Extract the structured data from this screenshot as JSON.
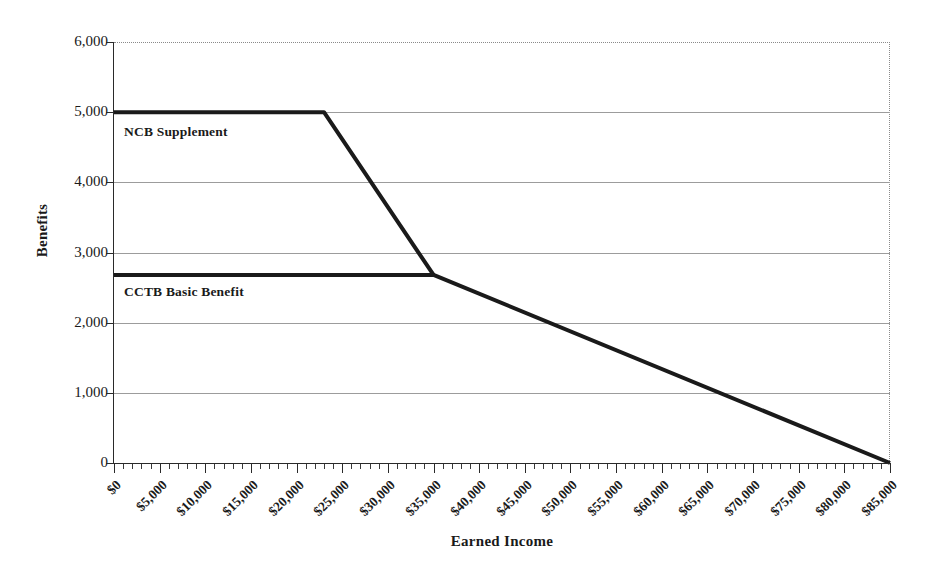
{
  "chart_data": {
    "type": "line",
    "title": "",
    "xlabel": "Earned Income",
    "ylabel": "Benefits",
    "xlim": [
      0,
      85000
    ],
    "ylim": [
      0,
      6000
    ],
    "grid": true,
    "legend_position": "inline-annotations",
    "x_tick_values": [
      0,
      5000,
      10000,
      15000,
      20000,
      25000,
      30000,
      35000,
      40000,
      45000,
      50000,
      55000,
      60000,
      65000,
      70000,
      75000,
      80000,
      85000
    ],
    "x_tick_labels": [
      "$0",
      "$5,000",
      "$10,000",
      "$15,000",
      "$20,000",
      "$25,000",
      "$30,000",
      "$35,000",
      "$40,000",
      "$45,000",
      "$50,000",
      "$55,000",
      "$60,000",
      "$65,000",
      "$70,000",
      "$75,000",
      "$80,000",
      "$85,000"
    ],
    "x_minor_tick_interval": 1000,
    "y_tick_values": [
      0,
      1000,
      2000,
      3000,
      4000,
      5000,
      6000
    ],
    "y_tick_labels": [
      "0",
      "1,000",
      "2,000",
      "3,000",
      "4,000",
      "5,000",
      "6,000"
    ],
    "series": [
      {
        "name": "NCB Supplement",
        "color": "#1a1a1a",
        "line_width": 4,
        "x": [
          0,
          23000,
          35000
        ],
        "values": [
          5000,
          5000,
          2680
        ]
      },
      {
        "name": "CCTB Basic Benefit",
        "color": "#1a1a1a",
        "line_width": 4,
        "x": [
          0,
          35000,
          85000
        ],
        "values": [
          2680,
          2680,
          0
        ]
      }
    ],
    "annotations": [
      {
        "text": "NCB Supplement",
        "x": 2000,
        "y": 4650
      },
      {
        "text": "CCTB Basic Benefit",
        "x": 2000,
        "y": 2350
      }
    ]
  },
  "axis_titles": {
    "x": "Earned Income",
    "y": "Benefits"
  }
}
